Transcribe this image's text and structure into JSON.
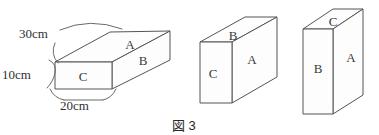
{
  "figure": {
    "caption": "図 3",
    "caption_cjk": "図",
    "caption_number": "3",
    "stroke_color": "#555555",
    "label_color": "#3a3a3a",
    "background": "#ffffff"
  },
  "dimensions": [
    {
      "id": "depth",
      "label": "30cm",
      "value": 30,
      "unit": "cm"
    },
    {
      "id": "height",
      "label": "10cm",
      "value": 10,
      "unit": "cm"
    },
    {
      "id": "width",
      "label": "20cm",
      "value": 20,
      "unit": "cm"
    }
  ],
  "views": [
    {
      "id": "view-1",
      "name": "flat-lying-box",
      "faces": [
        {
          "id": "v1-top",
          "label": "A",
          "position": "top"
        },
        {
          "id": "v1-side",
          "label": "B",
          "position": "right-side"
        },
        {
          "id": "v1-front",
          "label": "C",
          "position": "front"
        }
      ]
    },
    {
      "id": "view-2",
      "name": "long-horizontal-box",
      "faces": [
        {
          "id": "v2-top",
          "label": "B",
          "position": "top"
        },
        {
          "id": "v2-front",
          "label": "A",
          "position": "front"
        },
        {
          "id": "v2-side",
          "label": "C",
          "position": "left-side"
        }
      ]
    },
    {
      "id": "view-3",
      "name": "upright-box",
      "faces": [
        {
          "id": "v3-top",
          "label": "C",
          "position": "top"
        },
        {
          "id": "v3-front",
          "label": "A",
          "position": "front-right"
        },
        {
          "id": "v3-side",
          "label": "B",
          "position": "front-left"
        }
      ]
    }
  ]
}
